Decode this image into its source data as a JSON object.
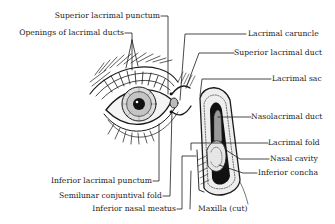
{
  "diagram": {
    "labels_left": {
      "superior_lacrimal_punctum": "Superior lacrimal punctum",
      "openings_of_lacrimal_ducts": "Openings of lacrimal ducts",
      "inferior_lacrimal_punctum": "Inferior lacrimal punctum",
      "semilunar_conjuntival_fold": "Semilunar conjuntival fold",
      "inferior_nasal_meatus": "Inferior nasal meatus"
    },
    "labels_right": {
      "lacrimal_caruncle": "Lacrimal caruncle",
      "superior_lacrimal_duct": "Superior lacrimal duct",
      "lacrimal_sac": "Lacrimal sac",
      "nasolacrimal_duct": "Nasolacrimal duct",
      "lacrimal_fold": "Lacrimal fold",
      "nasal_cavity": "Nasal cavity",
      "inferior_concha": "Inferior concha"
    },
    "labels_bottom": {
      "maxilla_cut": "Maxilla (cut)"
    },
    "colors": {
      "ink": "#1a1a1a",
      "background": "#ffffff",
      "shade": "#555555"
    }
  }
}
